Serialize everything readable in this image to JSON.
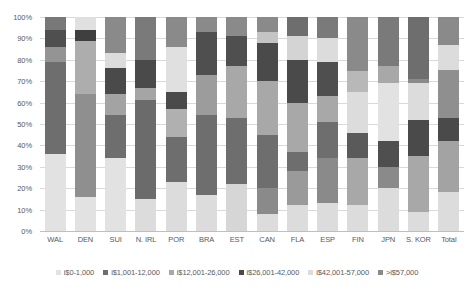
{
  "chart_data": {
    "type": "bar",
    "subtype": "100% stacked column",
    "title": "",
    "xlabel": "",
    "ylabel": "",
    "ylim": [
      0,
      100
    ],
    "ytick_labels": [
      "100%",
      "90%",
      "80%",
      "70%",
      "60%",
      "50%",
      "40%",
      "30%",
      "20%",
      "10%",
      "0%"
    ],
    "ytick_values": [
      100,
      90,
      80,
      70,
      60,
      50,
      40,
      30,
      20,
      10,
      0
    ],
    "grid": true,
    "legend_position": "bottom-center",
    "categories": [
      "WAL",
      "DEN",
      "SUI",
      "N. IRL",
      "POR",
      "BRA",
      "EST",
      "CAN",
      "FLA",
      "ESP",
      "FIN",
      "JPN",
      "S. KOR",
      "Total"
    ],
    "series": [
      {
        "name": "i$0-1,000",
        "color": "#e2e2e2",
        "values": [
          36,
          16,
          34,
          15,
          23,
          17,
          22,
          8,
          12,
          13,
          12,
          20,
          9,
          18
        ]
      },
      {
        "name": "i$1,001-12,000",
        "color": "#949494",
        "values": [
          0,
          0,
          10,
          0,
          13,
          0,
          0,
          12,
          16,
          21,
          22,
          0,
          26,
          0
        ]
      },
      {
        "name": "i$12,001-26,000",
        "color": "#6e6e6e",
        "values": [
          43,
          48,
          20,
          46,
          21,
          37,
          31,
          25,
          23,
          17,
          20,
          15,
          19,
          24
        ]
      },
      {
        "name": "i$26,001-42,000",
        "color": "#5a5a5a",
        "values": [
          0,
          0,
          0,
          0,
          0,
          0,
          0,
          0,
          0,
          0,
          0,
          8,
          0,
          0
        ]
      },
      {
        "name": "i$42,001-57,000",
        "color": "#c9c9c9",
        "values": [
          7,
          25,
          10,
          8,
          14,
          13,
          11,
          16,
          20,
          11,
          21,
          34,
          17,
          21
        ]
      },
      {
        "name": ">i$57,000",
        "color": "#767676",
        "values": [
          14,
          11,
          26,
          31,
          29,
          33,
          36,
          39,
          29,
          38,
          25,
          23,
          29,
          37
        ]
      }
    ],
    "stacks": {
      "WAL": [
        {
          "c": "#e2e2e2",
          "v": 36
        },
        {
          "c": "#6e6e6e",
          "v": 43
        },
        {
          "c": "#949494",
          "v": 7
        },
        {
          "c": "#4f4f4f",
          "v": 8
        },
        {
          "c": "#787878",
          "v": 6
        }
      ],
      "DEN": [
        {
          "c": "#e2e2e2",
          "v": 16
        },
        {
          "c": "#8f8f8f",
          "v": 48
        },
        {
          "c": "#adadad",
          "v": 25
        },
        {
          "c": "#3f3f3f",
          "v": 5
        },
        {
          "c": "#e0e0e0",
          "v": 6
        }
      ],
      "SUI": [
        {
          "c": "#e2e2e2",
          "v": 34
        },
        {
          "c": "#6e6e6e",
          "v": 20
        },
        {
          "c": "#a3a3a3",
          "v": 10
        },
        {
          "c": "#4a4a4a",
          "v": 12
        },
        {
          "c": "#dcdcdc",
          "v": 7
        },
        {
          "c": "#8a8a8a",
          "v": 17
        }
      ],
      "N. IRL": [
        {
          "c": "#dcdcdc",
          "v": 15
        },
        {
          "c": "#6b6b6b",
          "v": 46
        },
        {
          "c": "#a5a5a5",
          "v": 6
        },
        {
          "c": "#4a4a4a",
          "v": 13
        },
        {
          "c": "#7a7a7a",
          "v": 20
        }
      ],
      "POR": [
        {
          "c": "#dcdcdc",
          "v": 23
        },
        {
          "c": "#6e6e6e",
          "v": 21
        },
        {
          "c": "#b0b0b0",
          "v": 13
        },
        {
          "c": "#4a4a4a",
          "v": 8
        },
        {
          "c": "#e0e0e0",
          "v": 21
        },
        {
          "c": "#8a8a8a",
          "v": 14
        }
      ],
      "BRA": [
        {
          "c": "#dcdcdc",
          "v": 17
        },
        {
          "c": "#6e6e6e",
          "v": 37
        },
        {
          "c": "#9c9c9c",
          "v": 19
        },
        {
          "c": "#4f4f4f",
          "v": 20
        },
        {
          "c": "#8a8a8a",
          "v": 7
        }
      ],
      "EST": [
        {
          "c": "#d6d6d6",
          "v": 22
        },
        {
          "c": "#6e6e6e",
          "v": 31
        },
        {
          "c": "#a8a8a8",
          "v": 24
        },
        {
          "c": "#4f4f4f",
          "v": 14
        },
        {
          "c": "#8a8a8a",
          "v": 9
        }
      ],
      "CAN": [
        {
          "c": "#dcdcdc",
          "v": 8
        },
        {
          "c": "#8a8a8a",
          "v": 12
        },
        {
          "c": "#6e6e6e",
          "v": 25
        },
        {
          "c": "#a8a8a8",
          "v": 25
        },
        {
          "c": "#4a4a4a",
          "v": 18
        },
        {
          "c": "#c4c4c4",
          "v": 5
        },
        {
          "c": "#8a8a8a",
          "v": 7
        }
      ],
      "FLA": [
        {
          "c": "#dcdcdc",
          "v": 12
        },
        {
          "c": "#9a9a9a",
          "v": 16
        },
        {
          "c": "#6e6e6e",
          "v": 9
        },
        {
          "c": "#a8a8a8",
          "v": 23
        },
        {
          "c": "#4a4a4a",
          "v": 20
        },
        {
          "c": "#d4d4d4",
          "v": 11
        },
        {
          "c": "#6e6e6e",
          "v": 9
        }
      ],
      "ESP": [
        {
          "c": "#dcdcdc",
          "v": 13
        },
        {
          "c": "#8a8a8a",
          "v": 21
        },
        {
          "c": "#6e6e6e",
          "v": 17
        },
        {
          "c": "#a8a8a8",
          "v": 12
        },
        {
          "c": "#4f4f4f",
          "v": 16
        },
        {
          "c": "#dcdcdc",
          "v": 11
        },
        {
          "c": "#7a7a7a",
          "v": 10
        }
      ],
      "FIN": [
        {
          "c": "#dcdcdc",
          "v": 12
        },
        {
          "c": "#a8a8a8",
          "v": 22
        },
        {
          "c": "#5a5a5a",
          "v": 12
        },
        {
          "c": "#dcdcdc",
          "v": 19
        },
        {
          "c": "#b8b8b8",
          "v": 10
        },
        {
          "c": "#8a8a8a",
          "v": 25
        }
      ],
      "JPN": [
        {
          "c": "#dcdcdc",
          "v": 20
        },
        {
          "c": "#8a8a8a",
          "v": 10
        },
        {
          "c": "#4f4f4f",
          "v": 12
        },
        {
          "c": "#e2e2e2",
          "v": 27
        },
        {
          "c": "#a8a8a8",
          "v": 8
        },
        {
          "c": "#7a7a7a",
          "v": 23
        }
      ],
      "S. KOR": [
        {
          "c": "#dcdcdc",
          "v": 9
        },
        {
          "c": "#a8a8a8",
          "v": 26
        },
        {
          "c": "#4a4a4a",
          "v": 17
        },
        {
          "c": "#dcdcdc",
          "v": 17
        },
        {
          "c": "#8a8a8a",
          "v": 2
        },
        {
          "c": "#6e6e6e",
          "v": 29
        }
      ],
      "Total": [
        {
          "c": "#dcdcdc",
          "v": 18
        },
        {
          "c": "#a3a3a3",
          "v": 24
        },
        {
          "c": "#4a4a4a",
          "v": 11
        },
        {
          "c": "#8f8f8f",
          "v": 22
        },
        {
          "c": "#dcdcdc",
          "v": 12
        },
        {
          "c": "#8a8a8a",
          "v": 13
        }
      ]
    },
    "legend": [
      {
        "label": "i$0-1,000",
        "color": "#e2e2e2"
      },
      {
        "label": "i$1,001-12,000",
        "color": "#6e6e6e"
      },
      {
        "label": "i$12,001-26,000",
        "color": "#a8a8a8"
      },
      {
        "label": "i$26,001-42,000",
        "color": "#4a4a4a"
      },
      {
        "label": "i$42,001-57,000",
        "color": "#dcdcdc"
      },
      {
        "label": ">i$57,000",
        "color": "#8a8a8a"
      }
    ]
  }
}
